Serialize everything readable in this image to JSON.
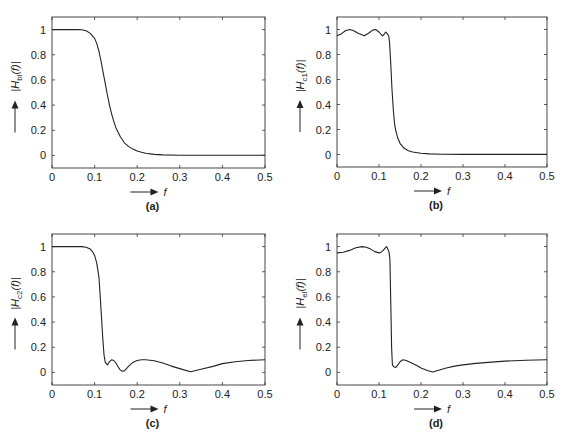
{
  "figure": {
    "panels": [
      {
        "id": "a",
        "caption": "(a)",
        "ylabel_main": "|H",
        "ylabel_sub": "bl",
        "ylabel_tail": "(f)|",
        "xlabel": "f",
        "box": {
          "left": 52,
          "right": 265,
          "top": 17,
          "bottom": 168
        }
      },
      {
        "id": "b",
        "caption": "(b)",
        "ylabel_main": "|H",
        "ylabel_sub": "c1",
        "ylabel_tail": "(f)|",
        "xlabel": "f",
        "box": {
          "left": 337,
          "right": 547,
          "top": 17,
          "bottom": 167
        }
      },
      {
        "id": "c",
        "caption": "(c)",
        "ylabel_main": "|H",
        "ylabel_sub": "c2",
        "ylabel_tail": "(f)|",
        "xlabel": "f",
        "box": {
          "left": 52,
          "right": 265,
          "top": 234,
          "bottom": 385
        }
      },
      {
        "id": "d",
        "caption": "(d)",
        "ylabel_main": "|H",
        "ylabel_sub": "el",
        "ylabel_tail": "(f)|",
        "xlabel": "f",
        "box": {
          "left": 337,
          "right": 547,
          "top": 234,
          "bottom": 385
        }
      }
    ],
    "x_ticks": [
      "0",
      "0.1",
      "0.2",
      "0.3",
      "0.4",
      "0.5"
    ],
    "y_ticks": [
      "0",
      "0.2",
      "0.4",
      "0.6",
      "0.8",
      "1"
    ]
  },
  "chart_data": [
    {
      "type": "line",
      "title": "(a)",
      "xlabel": "f",
      "ylabel": "|H_bl(f)|",
      "xlim": [
        0,
        0.5
      ],
      "ylim": [
        -0.1,
        1.1
      ],
      "x_ticks": [
        0,
        0.1,
        0.2,
        0.3,
        0.4,
        0.5
      ],
      "y_ticks": [
        0,
        0.2,
        0.4,
        0.6,
        0.8,
        1
      ],
      "grid": false,
      "x": [
        0,
        0.02,
        0.04,
        0.06,
        0.07,
        0.08,
        0.09,
        0.1,
        0.105,
        0.11,
        0.115,
        0.12,
        0.125,
        0.13,
        0.135,
        0.14,
        0.145,
        0.15,
        0.16,
        0.17,
        0.18,
        0.19,
        0.2,
        0.21,
        0.22,
        0.24,
        0.26,
        0.3,
        0.35,
        0.4,
        0.45,
        0.5
      ],
      "values": [
        1,
        1,
        1,
        1,
        0.998,
        0.99,
        0.97,
        0.93,
        0.89,
        0.83,
        0.75,
        0.66,
        0.57,
        0.48,
        0.4,
        0.33,
        0.27,
        0.22,
        0.15,
        0.1,
        0.07,
        0.05,
        0.035,
        0.025,
        0.017,
        0.008,
        0.004,
        0.002,
        0.001,
        0.001,
        0.001,
        0.001
      ]
    },
    {
      "type": "line",
      "title": "(b)",
      "xlabel": "f",
      "ylabel": "|H_c1(f)|",
      "xlim": [
        0,
        0.5
      ],
      "ylim": [
        -0.1,
        1.1
      ],
      "x_ticks": [
        0,
        0.1,
        0.2,
        0.3,
        0.4,
        0.5
      ],
      "y_ticks": [
        0,
        0.2,
        0.4,
        0.6,
        0.8,
        1
      ],
      "grid": false,
      "x": [
        0,
        0.01,
        0.02,
        0.03,
        0.04,
        0.05,
        0.065,
        0.075,
        0.085,
        0.092,
        0.1,
        0.108,
        0.112,
        0.116,
        0.12,
        0.123,
        0.125,
        0.128,
        0.131,
        0.134,
        0.137,
        0.14,
        0.145,
        0.15,
        0.16,
        0.17,
        0.18,
        0.2,
        0.22,
        0.25,
        0.3,
        0.4,
        0.5
      ],
      "values": [
        0.95,
        0.965,
        0.99,
        1.0,
        0.99,
        0.97,
        0.95,
        0.97,
        0.995,
        1.0,
        0.98,
        0.95,
        0.96,
        0.98,
        0.965,
        0.95,
        0.9,
        0.72,
        0.52,
        0.36,
        0.25,
        0.19,
        0.13,
        0.09,
        0.05,
        0.03,
        0.02,
        0.01,
        0.005,
        0.002,
        0.001,
        0.001,
        0.001
      ]
    },
    {
      "type": "line",
      "title": "(c)",
      "xlabel": "f",
      "ylabel": "|H_c2(f)|",
      "xlim": [
        0,
        0.5
      ],
      "ylim": [
        -0.1,
        1.1
      ],
      "x_ticks": [
        0,
        0.1,
        0.2,
        0.3,
        0.4,
        0.5
      ],
      "y_ticks": [
        0,
        0.2,
        0.4,
        0.6,
        0.8,
        1
      ],
      "grid": false,
      "x": [
        0,
        0.04,
        0.07,
        0.08,
        0.09,
        0.095,
        0.1,
        0.105,
        0.11,
        0.113,
        0.116,
        0.119,
        0.122,
        0.125,
        0.13,
        0.135,
        0.14,
        0.145,
        0.15,
        0.155,
        0.16,
        0.165,
        0.17,
        0.175,
        0.18,
        0.19,
        0.2,
        0.21,
        0.22,
        0.24,
        0.26,
        0.28,
        0.3,
        0.325,
        0.35,
        0.38,
        0.4,
        0.43,
        0.46,
        0.5
      ],
      "values": [
        1,
        1,
        1,
        0.995,
        0.98,
        0.96,
        0.93,
        0.87,
        0.76,
        0.62,
        0.45,
        0.28,
        0.14,
        0.08,
        0.06,
        0.085,
        0.1,
        0.095,
        0.075,
        0.045,
        0.02,
        0.01,
        0.012,
        0.03,
        0.05,
        0.08,
        0.095,
        0.1,
        0.1,
        0.092,
        0.075,
        0.05,
        0.03,
        0.005,
        0.025,
        0.05,
        0.07,
        0.085,
        0.095,
        0.1
      ]
    },
    {
      "type": "line",
      "title": "(d)",
      "xlabel": "f",
      "ylabel": "|H_el(f)|",
      "xlim": [
        0,
        0.5
      ],
      "ylim": [
        -0.1,
        1.1
      ],
      "x_ticks": [
        0,
        0.1,
        0.2,
        0.3,
        0.4,
        0.5
      ],
      "y_ticks": [
        0,
        0.2,
        0.4,
        0.6,
        0.8,
        1
      ],
      "grid": false,
      "x": [
        0,
        0.015,
        0.03,
        0.045,
        0.06,
        0.07,
        0.08,
        0.09,
        0.1,
        0.105,
        0.11,
        0.115,
        0.118,
        0.121,
        0.124,
        0.126,
        0.128,
        0.13,
        0.132,
        0.135,
        0.14,
        0.145,
        0.15,
        0.157,
        0.165,
        0.175,
        0.19,
        0.2,
        0.215,
        0.228,
        0.24,
        0.26,
        0.28,
        0.3,
        0.33,
        0.36,
        0.4,
        0.45,
        0.5
      ],
      "values": [
        0.95,
        0.955,
        0.97,
        0.99,
        1.0,
        0.995,
        0.98,
        0.96,
        0.95,
        0.955,
        0.97,
        0.99,
        1.0,
        0.98,
        0.955,
        0.9,
        0.55,
        0.2,
        0.06,
        0.045,
        0.04,
        0.06,
        0.085,
        0.1,
        0.095,
        0.08,
        0.055,
        0.035,
        0.015,
        0.003,
        0.015,
        0.035,
        0.05,
        0.06,
        0.072,
        0.08,
        0.09,
        0.097,
        0.1
      ]
    }
  ]
}
